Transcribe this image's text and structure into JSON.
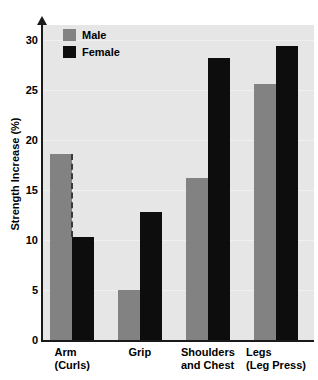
{
  "chart_data": {
    "type": "bar",
    "title": "",
    "xlabel": "",
    "ylabel": "Strength Increase (%)",
    "ylim": [
      0,
      30
    ],
    "yticks": [
      0,
      5,
      10,
      15,
      20,
      25,
      30
    ],
    "ytick_labels": [
      "0",
      "5",
      "10",
      "15",
      "20",
      "25",
      "30"
    ],
    "grid": true,
    "legend_position": "top-left",
    "categories": [
      {
        "line1": "Arm",
        "line2": "(Curls)"
      },
      {
        "line1": "Grip",
        "line2": ""
      },
      {
        "line1": "Shoulders",
        "line2": "and Chest"
      },
      {
        "line1": "Legs",
        "line2": "(Leg Press)"
      }
    ],
    "category_labels": [
      "Arm (Curls)",
      "Grip",
      "Shoulders and Chest",
      "Legs (Leg Press)"
    ],
    "series": [
      {
        "name": "Male",
        "color": "#828282",
        "values": [
          18.6,
          5.0,
          16.2,
          25.6
        ]
      },
      {
        "name": "Female",
        "color": "#0d0d0d",
        "values": [
          10.3,
          12.8,
          28.2,
          29.4
        ]
      }
    ],
    "annotations": [
      {
        "kind": "dashed-vertical-line",
        "category": "Arm (Curls)",
        "from": 18.6,
        "to": 10.3
      }
    ],
    "plot_background": "#e6e6e6",
    "axis_color": "#1a1a1a"
  },
  "legend": {
    "items": [
      {
        "label": "Male",
        "swatch": "male"
      },
      {
        "label": "Female",
        "swatch": "female"
      }
    ]
  }
}
